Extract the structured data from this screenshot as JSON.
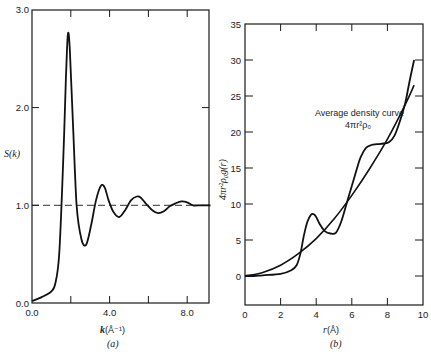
{
  "chart_data": [
    {
      "panel": "(a)",
      "type": "line",
      "title": "",
      "xlabel": "k (Å⁻¹)",
      "ylabel": "S(k)",
      "xlim": [
        0,
        9.2
      ],
      "ylim": [
        0,
        3.0
      ],
      "x_ticks": [
        "0.0",
        "4.0",
        "8.0"
      ],
      "y_ticks": [
        "0.0",
        "1.0",
        "2.0",
        "3.0"
      ],
      "grid": false,
      "reference_line": {
        "y": 1.0,
        "style": "dashed"
      },
      "series": [
        {
          "name": "S(k)",
          "x": [
            0.0,
            0.5,
            1.0,
            1.2,
            1.4,
            1.6,
            1.75,
            1.85,
            1.95,
            2.1,
            2.3,
            2.55,
            2.8,
            3.05,
            3.3,
            3.55,
            3.75,
            3.95,
            4.2,
            4.5,
            4.8,
            5.1,
            5.4,
            5.6,
            5.9,
            6.2,
            6.5,
            6.8,
            7.1,
            7.4,
            7.7,
            8.0,
            8.3,
            8.7,
            9.2
          ],
          "values": [
            0.02,
            0.06,
            0.12,
            0.2,
            0.5,
            1.4,
            2.3,
            2.75,
            2.6,
            1.9,
            1.0,
            0.65,
            0.6,
            0.8,
            1.05,
            1.2,
            1.18,
            1.05,
            0.93,
            0.88,
            0.95,
            1.05,
            1.09,
            1.08,
            1.01,
            0.95,
            0.92,
            0.94,
            0.99,
            1.02,
            1.04,
            1.03,
            1.0,
            1.0,
            1.0
          ]
        }
      ],
      "caption": "(a)"
    },
    {
      "panel": "(b)",
      "type": "line",
      "title": "",
      "xlabel": "r (Å)",
      "ylabel": "4πr²ρ₀g(r)",
      "xlim": [
        0,
        10
      ],
      "ylim": [
        -4,
        35
      ],
      "x_ticks": [
        "0",
        "2",
        "4",
        "6",
        "8",
        "10"
      ],
      "y_ticks": [
        "0",
        "5",
        "10",
        "15",
        "20",
        "25",
        "30",
        "35"
      ],
      "grid": false,
      "annotation": {
        "text": "Average density curve",
        "formula": "4πr²ρ₀",
        "x": 6.9,
        "y": 22.5
      },
      "series": [
        {
          "name": "4πr²ρ₀g(r)",
          "x": [
            0.0,
            0.5,
            1.0,
            2.0,
            2.6,
            2.9,
            3.1,
            3.3,
            3.5,
            3.7,
            3.85,
            4.0,
            4.2,
            4.5,
            4.8,
            5.1,
            5.4,
            5.7,
            6.0,
            6.3,
            6.5,
            6.8,
            7.1,
            7.4,
            7.8,
            8.1,
            8.4,
            8.7,
            9.0,
            9.2,
            9.5
          ],
          "values": [
            0.0,
            0.0,
            0.1,
            0.3,
            0.8,
            1.5,
            3.0,
            5.5,
            7.5,
            8.5,
            8.6,
            8.2,
            7.2,
            6.2,
            5.9,
            6.0,
            7.5,
            10.0,
            12.5,
            15.0,
            16.5,
            17.8,
            18.2,
            18.3,
            18.4,
            18.6,
            19.5,
            21.5,
            24.0,
            26.5,
            30.0
          ]
        },
        {
          "name": "Average density curve 4πr²ρ₀",
          "x": [
            0,
            1,
            2,
            3,
            4,
            5,
            6,
            7,
            8,
            9,
            9.5
          ],
          "values": [
            0.0,
            0.5,
            1.5,
            3.1,
            5.2,
            7.9,
            11.2,
            14.9,
            19.0,
            23.8,
            26.5
          ]
        }
      ],
      "caption": "(b)"
    }
  ],
  "panels": {
    "a": {
      "ylabel": "S(k)",
      "xlabel_main": "k",
      "xlabel_unit": "(Å⁻¹)",
      "caption": "(a)",
      "y_ticks": [
        "0.0",
        "1.0",
        "2.0",
        "3.0"
      ],
      "x_ticks": [
        "0.0",
        "4.0",
        "8.0"
      ]
    },
    "b": {
      "ylabel": "4πr²ρ₀g(r)",
      "xlabel_main": "r",
      "xlabel_unit": "(Å)",
      "caption": "(b)",
      "annotation_line1": "Average density curve",
      "annotation_line2": "4πr²ρ₀",
      "y_ticks": [
        "0",
        "5",
        "10",
        "15",
        "20",
        "25",
        "30",
        "35"
      ],
      "x_ticks": [
        "0",
        "2",
        "4",
        "6",
        "8",
        "10"
      ]
    }
  }
}
